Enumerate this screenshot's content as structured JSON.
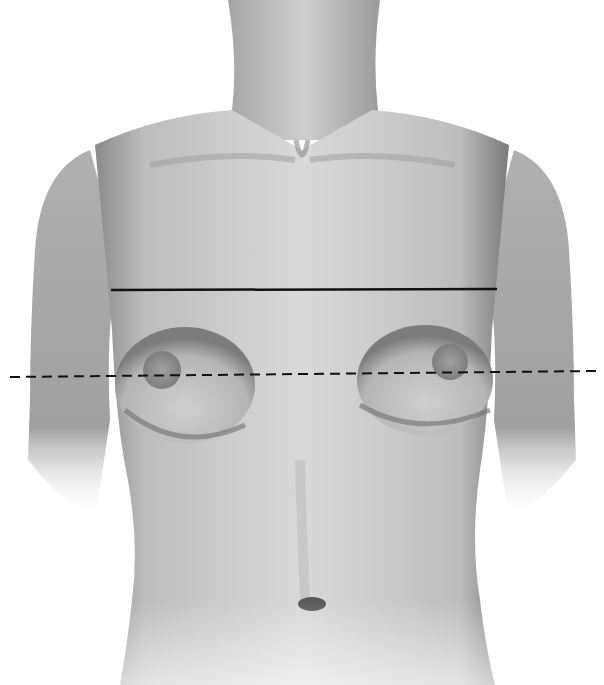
{
  "figure": {
    "colors": {
      "background": "#ffffff",
      "skin_light": "#d6d6d6",
      "skin_mid": "#a8a8a8",
      "skin_dark": "#6e6e6e",
      "areola": "#8a8a8a",
      "line": "#111111"
    },
    "reference_lines": [
      {
        "name": "upper-chest-line",
        "style": "solid",
        "x1": 111,
        "y1": 290,
        "x2": 497,
        "y2": 289
      },
      {
        "name": "nipple-line",
        "style": "dashed",
        "x1": 10,
        "y1": 377,
        "x2": 598,
        "y2": 371
      }
    ]
  }
}
